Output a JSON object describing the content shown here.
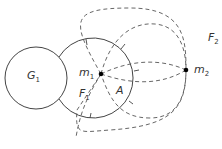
{
  "labels": {
    "g1": {
      "main": "G",
      "sub": "1"
    },
    "m1": {
      "main": "m",
      "sub": "1"
    },
    "m2": {
      "main": "m",
      "sub": "2"
    },
    "f1": {
      "main": "F",
      "sub": "1"
    },
    "f2": {
      "main": "F",
      "sub": "2"
    },
    "a": {
      "main": "A"
    }
  },
  "colors": {
    "stroke": "#444444",
    "point": "#000000"
  }
}
